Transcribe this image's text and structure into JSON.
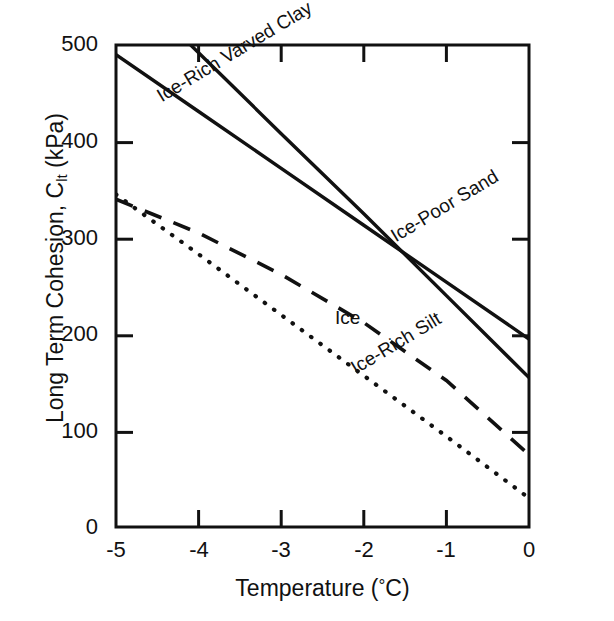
{
  "figure": {
    "background_color": "#ffffff",
    "ink_color": "#111111"
  },
  "axes": {
    "ylabel_main": "Long Term Cohesion, C",
    "ylabel_sub": "lt",
    "ylabel_unit": " (kPa)",
    "ylabel_full": "Long Term Cohesion, C_lt (kPa)",
    "xlabel_main": "Temperature (",
    "xlabel_deg": "°",
    "xlabel_tail": "C)",
    "xlabel_full": "Temperature (°C)",
    "ytick_labels": [
      "500",
      "400",
      "300",
      "200",
      "100",
      "0"
    ],
    "xtick_labels": [
      "-5",
      "-4",
      "-3",
      "-2",
      "-1",
      "0"
    ]
  },
  "chart_data": {
    "type": "line",
    "title": "",
    "subtitle": "",
    "xlabel": "Temperature (°C)",
    "ylabel": "Long Term Cohesion, C_lt (kPa)",
    "xlim": [
      -5,
      0
    ],
    "ylim": [
      0,
      500
    ],
    "xticks": [
      -5,
      -4,
      -3,
      -2,
      -1,
      0
    ],
    "yticks": [
      0,
      100,
      200,
      300,
      400,
      500
    ],
    "grid": false,
    "legend_position": "inline-annotations",
    "x": [
      -5,
      -4,
      -3,
      -2,
      -1,
      0
    ],
    "series": [
      {
        "name": "Ice-Rich Varved Clay",
        "style": "solid",
        "label_angle_deg": 31,
        "values": [
          575,
          492,
          408,
          325,
          240,
          155
        ],
        "x_start": -5.0,
        "y_start_clipped_at_axis_top": 500
      },
      {
        "name": "Ice-Poor Sand",
        "style": "solid",
        "label_angle_deg": 31,
        "values": [
          490,
          431,
          372,
          313,
          254,
          195
        ]
      },
      {
        "name": "Ice",
        "style": "dashed",
        "label_angle_deg": 0,
        "values": [
          340,
          305,
          262,
          212,
          152,
          75
        ]
      },
      {
        "name": "Ice-Rich Silt",
        "style": "dotted",
        "label_angle_deg": 31,
        "values": [
          345,
          283,
          220,
          157,
          94,
          30
        ]
      }
    ],
    "annotations": [
      {
        "text": "Ice-Rich Varved Clay",
        "x": -4.55,
        "y": 455,
        "rotation": -31
      },
      {
        "text": "Ice-Poor Sand",
        "x": -1.72,
        "y": 310,
        "rotation": -31
      },
      {
        "text": "Ice",
        "x": -2.35,
        "y": 228,
        "rotation": 0
      },
      {
        "text": "Ice-Rich Silt",
        "x": -2.2,
        "y": 173,
        "rotation": -31
      }
    ]
  }
}
